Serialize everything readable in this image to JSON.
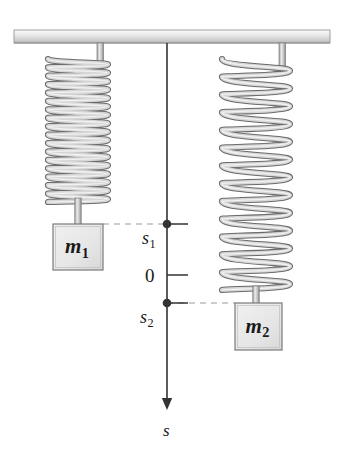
{
  "figure": {
    "background_color": "#ffffff"
  },
  "ceiling": {
    "name": "support-ceiling",
    "x": 14,
    "y": 30,
    "width": 316,
    "height": 13,
    "fill_top": "#f2f2f2",
    "fill_bottom": "#c8c8c8",
    "stroke": "#8a8a8a"
  },
  "springs": [
    {
      "id": "spring-1",
      "label": "left spring (compressed / tightly coiled)",
      "center_x": 78,
      "top_y": 43,
      "bottom_y": 202,
      "coil_radius_x": 30,
      "coil_count": 17,
      "rod_top_y": 202,
      "rod_bottom_y": 224,
      "stroke": "#6e6e6e",
      "fill": "#dcdcdc"
    },
    {
      "id": "spring-2",
      "label": "right spring (stretched / loosely coiled)",
      "center_x": 256,
      "top_y": 43,
      "bottom_y": 290,
      "coil_radius_x": 34,
      "coil_count": 13,
      "rod_top_y": 290,
      "rod_bottom_y": 303,
      "stroke": "#6e6e6e",
      "fill": "#dcdcdc"
    }
  ],
  "masses": [
    {
      "id": "mass-1",
      "symbol": "m",
      "subscript": "1",
      "x": 53,
      "y": 224,
      "width": 50,
      "height": 46,
      "fill": "#e8e8e8",
      "stroke": "#7a7a7a"
    },
    {
      "id": "mass-2",
      "symbol": "m",
      "subscript": "2",
      "x": 235,
      "y": 303,
      "width": 47,
      "height": 47,
      "fill": "#e8e8e8",
      "stroke": "#7a7a7a"
    }
  ],
  "axis": {
    "name": "displacement-axis-s",
    "x": 167,
    "top_y": 43,
    "arrow_tip_y": 410,
    "color": "#333333",
    "axis_label": "s",
    "axis_label_y": 422,
    "ticks": [
      {
        "id": "tick-s1",
        "label": "s",
        "subscript": "1",
        "y": 224,
        "marker": "filled-dot",
        "tick_extends": "right",
        "tick_length": 21,
        "label_x": 142,
        "label_y": 229
      },
      {
        "id": "tick-zero",
        "label": "0",
        "subscript": "",
        "y": 275,
        "marker": "none",
        "tick_extends": "right",
        "tick_length": 21,
        "label_x": 145,
        "label_y": 266
      },
      {
        "id": "tick-s2",
        "label": "s",
        "subscript": "2",
        "y": 303,
        "marker": "filled-dot",
        "tick_extends": "right",
        "tick_length": 21,
        "label_x": 140,
        "label_y": 308
      }
    ]
  },
  "leader_lines": [
    {
      "id": "leader-mass1-to-s1",
      "from_x": 103,
      "to_x": 167,
      "y": 224,
      "style": "dashed",
      "color": "#9a9a9a"
    },
    {
      "id": "leader-s2-to-mass2",
      "from_x": 167,
      "to_x": 235,
      "y": 303,
      "style": "dashed",
      "color": "#9a9a9a"
    }
  ]
}
